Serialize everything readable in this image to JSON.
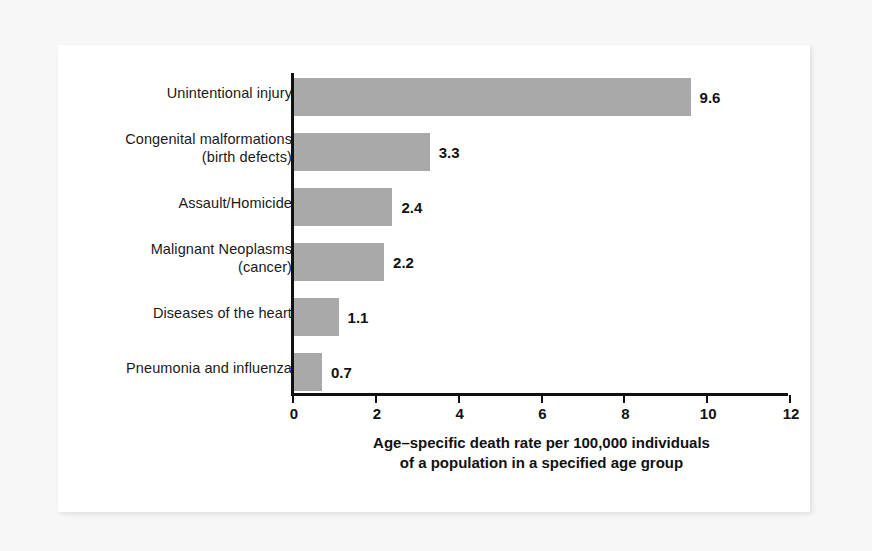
{
  "chart_data": {
    "type": "bar",
    "orientation": "horizontal",
    "title": "",
    "subtitle": "",
    "xlabel_line1": "Age–specific death rate per 100,000 individuals",
    "xlabel_line2": "of a population in a specified age group",
    "ylabel": "",
    "categories": [
      "Unintentional injury",
      "Congenital malformations (birth defects)",
      "Assault/Homicide",
      "Malignant Neoplasms (cancer)",
      "Diseases of the heart",
      "Pneumonia and influenza"
    ],
    "category_lines": [
      [
        "Unintentional injury",
        ""
      ],
      [
        "Congenital malformations",
        "(birth defects)"
      ],
      [
        "Assault/Homicide",
        ""
      ],
      [
        "Malignant Neoplasms",
        "(cancer)"
      ],
      [
        "Diseases of the heart",
        ""
      ],
      [
        "Pneumonia and influenza",
        ""
      ]
    ],
    "values": [
      9.6,
      3.3,
      2.4,
      2.2,
      1.1,
      0.7
    ],
    "value_labels": [
      "9.6",
      "3.3",
      "2.4",
      "2.2",
      "1.1",
      "0.7"
    ],
    "xlim": [
      0,
      12
    ],
    "xticks": [
      0,
      2,
      4,
      6,
      8,
      10,
      12
    ],
    "xtick_labels": [
      "0",
      "2",
      "4",
      "6",
      "8",
      "10",
      "12"
    ],
    "grid": false,
    "legend": false,
    "bar_color": "#a9a9a9",
    "axis_color": "#111111",
    "text_color": "#121212",
    "background_color": "#ffffff",
    "page_background_color": "#f7f7f7"
  }
}
